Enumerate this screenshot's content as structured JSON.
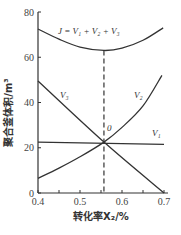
{
  "chart_data": {
    "type": "line",
    "title": "",
    "xlabel": "转化率X₂/%",
    "ylabel": "聚合釜体积/m³",
    "xlim": [
      0.4,
      0.7
    ],
    "ylim": [
      0,
      80
    ],
    "xticks": [
      "0.4",
      "0.5",
      "0.6",
      "0.7"
    ],
    "yticks": [
      "0",
      "20",
      "40",
      "60",
      "80"
    ],
    "grid": false,
    "series": [
      {
        "name": "J = V₁ + V₂ + V₃",
        "x": [
          0.4,
          0.45,
          0.5,
          0.557,
          0.6,
          0.65,
          0.698
        ],
        "y": [
          72.5,
          68,
          64.5,
          63,
          64,
          67.5,
          73
        ]
      },
      {
        "name": "V₁",
        "x": [
          0.4,
          0.7
        ],
        "y": [
          22.5,
          21.5
        ]
      },
      {
        "name": "V₂",
        "x": [
          0.4,
          0.45,
          0.5,
          0.557,
          0.6,
          0.65,
          0.695
        ],
        "y": [
          6.5,
          11,
          16,
          22.5,
          29,
          38.5,
          52
        ]
      },
      {
        "name": "V₃",
        "x": [
          0.4,
          0.557,
          0.7
        ],
        "y": [
          49.5,
          22.5,
          0
        ]
      }
    ],
    "annotations": [
      {
        "text": "0",
        "x": 0.557,
        "y": 22.5,
        "note": "optimal point, vertical dashed line at minimum of J"
      },
      {
        "text": "J = V₁ + V₂ + V₃"
      },
      {
        "text": "V₁"
      },
      {
        "text": "V₂"
      },
      {
        "text": "V₃"
      }
    ],
    "optimum_x": 0.557
  },
  "labels": {
    "j_formula": "J = V₁ + V₂ + V₃",
    "v1": "V₁",
    "v2": "V₂",
    "v3": "V₃",
    "opt_point": "0"
  }
}
